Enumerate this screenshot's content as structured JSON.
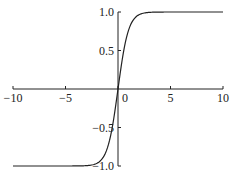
{
  "chart_data": {
    "type": "line",
    "title": "",
    "xlabel": "",
    "ylabel": "",
    "xlim": [
      -10,
      10
    ],
    "ylim": [
      -1.0,
      1.0
    ],
    "grid": false,
    "legend": null,
    "x_ticks": [
      -10,
      -5,
      0,
      5,
      10
    ],
    "x_tick_labels": [
      "-10",
      "-5",
      "0",
      "5",
      "10"
    ],
    "y_ticks": [
      1.0,
      0.5,
      -0.5,
      -1.0
    ],
    "y_tick_labels": [
      "1.0",
      "0.5",
      "-0.5",
      "-1.0"
    ],
    "series": [
      {
        "name": "tanh(x)",
        "x": [
          -10,
          -8,
          -6,
          -4,
          -3,
          -2.5,
          -2,
          -1.5,
          -1,
          -0.5,
          0,
          0.5,
          1,
          1.5,
          2,
          2.5,
          3,
          4,
          6,
          8,
          10
        ],
        "values": [
          -1.0,
          -1.0,
          -1.0,
          -0.999,
          -0.995,
          -0.987,
          -0.964,
          -0.905,
          -0.762,
          -0.462,
          0.0,
          0.462,
          0.762,
          0.905,
          0.964,
          0.987,
          0.995,
          0.999,
          1.0,
          1.0,
          1.0
        ]
      }
    ]
  }
}
